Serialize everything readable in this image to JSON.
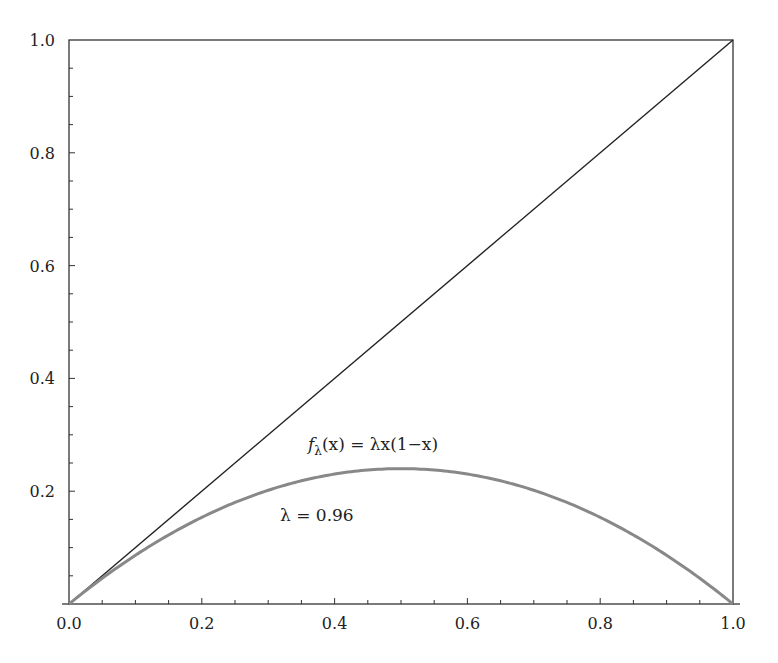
{
  "chart_data": {
    "type": "line",
    "title": "",
    "xlabel": "",
    "ylabel": "",
    "xlim": [
      0.0,
      1.0
    ],
    "ylim": [
      0.0,
      1.0
    ],
    "grid": false,
    "x_ticks": [
      "0.0",
      "0.2",
      "0.4",
      "0.6",
      "0.8",
      "1.0"
    ],
    "y_ticks": [
      "0.2",
      "0.4",
      "0.6",
      "0.8",
      "1.0"
    ],
    "minor_tick_step": 0.05,
    "series": [
      {
        "name": "y = x",
        "color": "#222222",
        "x": [
          0.0,
          1.0
        ],
        "y": [
          0.0,
          1.0
        ]
      },
      {
        "name": "f_lambda(x) = lambda x (1 - x)",
        "color": "#888888",
        "lambda": 0.96,
        "x": [
          0.0,
          0.1,
          0.2,
          0.3,
          0.4,
          0.5,
          0.6,
          0.7,
          0.8,
          0.9,
          1.0
        ],
        "y": [
          0.0,
          0.0864,
          0.1536,
          0.2016,
          0.2304,
          0.24,
          0.2304,
          0.2016,
          0.1536,
          0.0864,
          0.0
        ]
      }
    ],
    "annotations": [
      {
        "text_f": "f",
        "text_sub": "λ",
        "text_rest": "(x) = λx(1−x)",
        "x": 0.36,
        "y": 0.28
      },
      {
        "text": "λ = 0.96",
        "x": 0.32,
        "y": 0.14
      }
    ]
  }
}
